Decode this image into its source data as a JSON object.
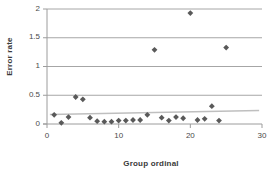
{
  "chart_data": {
    "type": "scatter",
    "title": "",
    "xlabel": "Group ordinal",
    "ylabel": "Error rate",
    "xlim": [
      0,
      30
    ],
    "ylim": [
      0,
      2
    ],
    "xticks": [
      "0",
      "10",
      "20",
      "30"
    ],
    "xtick_values": [
      0,
      10,
      20,
      30
    ],
    "yticks": [
      "0",
      "0.5",
      "1",
      "1.5",
      "2"
    ],
    "ytick_values": [
      0,
      0.5,
      1,
      1.5,
      2
    ],
    "grid": "horizontal",
    "legend": "none",
    "marker": "diamond",
    "marker_color": "#595959",
    "gridline_color": "#a6a6a6",
    "axis_color": "#9c9c9c",
    "trendline": {
      "present": true,
      "color": "#bfbfbf",
      "x_start": 0.4,
      "y_start": 0.165,
      "x_end": 29.6,
      "y_end": 0.235
    },
    "series": [
      {
        "name": "Error rate",
        "points": [
          {
            "x": 1,
            "y": 0.16
          },
          {
            "x": 2,
            "y": 0.02
          },
          {
            "x": 3,
            "y": 0.12
          },
          {
            "x": 4,
            "y": 0.47
          },
          {
            "x": 5,
            "y": 0.43
          },
          {
            "x": 6,
            "y": 0.11
          },
          {
            "x": 7,
            "y": 0.05
          },
          {
            "x": 8,
            "y": 0.04
          },
          {
            "x": 9,
            "y": 0.04
          },
          {
            "x": 10,
            "y": 0.06
          },
          {
            "x": 11,
            "y": 0.06
          },
          {
            "x": 12,
            "y": 0.07
          },
          {
            "x": 13,
            "y": 0.07
          },
          {
            "x": 14,
            "y": 0.16
          },
          {
            "x": 15,
            "y": 1.29
          },
          {
            "x": 16,
            "y": 0.11
          },
          {
            "x": 17,
            "y": 0.06
          },
          {
            "x": 18,
            "y": 0.12
          },
          {
            "x": 19,
            "y": 0.1
          },
          {
            "x": 20,
            "y": 1.93
          },
          {
            "x": 21,
            "y": 0.07
          },
          {
            "x": 22,
            "y": 0.09
          },
          {
            "x": 23,
            "y": 0.31
          },
          {
            "x": 24,
            "y": 0.06
          },
          {
            "x": 25,
            "y": 1.33
          }
        ]
      }
    ]
  }
}
